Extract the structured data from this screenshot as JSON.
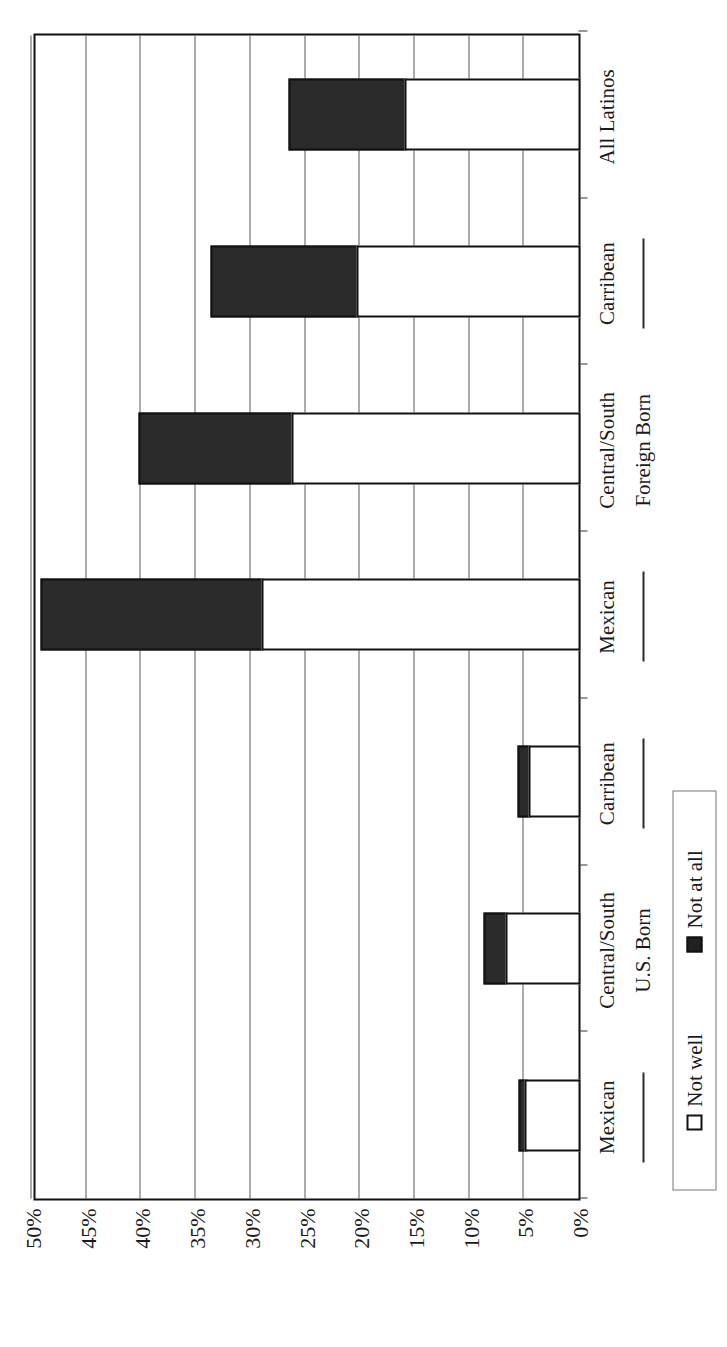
{
  "chart_data": {
    "type": "bar",
    "orientation": "horizontal-stacked",
    "title": "",
    "xlabel": "",
    "ylabel": "",
    "ylim": [
      0,
      50
    ],
    "grid": true,
    "legend_position": "bottom-right",
    "categories": [
      "Mexican",
      "Central/South",
      "Carribean",
      "Mexican",
      "Central/South",
      "Carribean",
      "All Latinos"
    ],
    "groups": [
      {
        "label": "U.S. Born",
        "categories": [
          "Mexican",
          "Central/South",
          "Carribean"
        ]
      },
      {
        "label": "Foreign Born",
        "categories": [
          "Mexican",
          "Central/South",
          "Carribean"
        ]
      },
      {
        "label": "",
        "categories": [
          "All Latinos"
        ]
      }
    ],
    "series": [
      {
        "name": "Not well",
        "color": "#ffffff",
        "values": [
          5.1,
          6.9,
          4.8,
          29.2,
          26.4,
          20.5,
          16.1
        ]
      },
      {
        "name": "Not at all",
        "color": "#2b2b2b",
        "values": [
          0.8,
          2.2,
          1.2,
          20.4,
          14.2,
          13.5,
          10.8
        ]
      }
    ],
    "tick_labels": [
      "0%",
      "5%",
      "10%",
      "15%",
      "20%",
      "25%",
      "30%",
      "35%",
      "40%",
      "45%",
      "50%"
    ],
    "tick_values": [
      0,
      5,
      10,
      15,
      20,
      25,
      30,
      35,
      40,
      45,
      50
    ]
  },
  "legend": {
    "items": [
      {
        "label": "Not well",
        "swatch": "open-square-icon"
      },
      {
        "label": "Not at all",
        "swatch": "filled-square-icon"
      }
    ]
  },
  "axis": {
    "ticks": [
      {
        "label": "0%",
        "value": 0
      },
      {
        "label": "5%",
        "value": 5
      },
      {
        "label": "10%",
        "value": 10
      },
      {
        "label": "15%",
        "value": 15
      },
      {
        "label": "20%",
        "value": 20
      },
      {
        "label": "25%",
        "value": 25
      },
      {
        "label": "30%",
        "value": 30
      },
      {
        "label": "35%",
        "value": 35
      },
      {
        "label": "40%",
        "value": 40
      },
      {
        "label": "45%",
        "value": 45
      },
      {
        "label": "50%",
        "value": 50
      }
    ]
  },
  "categories": [
    {
      "label": "Mexican",
      "group": "U.S. Born"
    },
    {
      "label": "Central/South",
      "group": "U.S. Born"
    },
    {
      "label": "Carribean",
      "group": "U.S. Born"
    },
    {
      "label": "Mexican",
      "group": "Foreign Born"
    },
    {
      "label": "Central/South",
      "group": "Foreign Born"
    },
    {
      "label": "Carribean",
      "group": "Foreign Born"
    },
    {
      "label": "All Latinos",
      "group": ""
    }
  ],
  "groups": [
    {
      "label": "U.S. Born"
    },
    {
      "label": "Foreign Born"
    }
  ]
}
